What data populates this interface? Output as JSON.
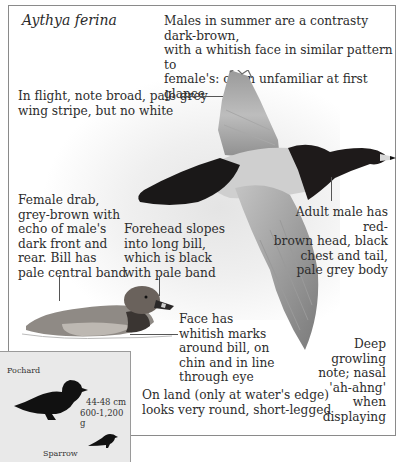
{
  "species": {
    "latin_name": "Aythya ferina",
    "common_name": "Pochard"
  },
  "annotations": {
    "summary": [
      "Males in summer are a contrasty dark-brown,",
      "with a whitish face in similar pattern to",
      "female's: often unfamiliar at first glance"
    ],
    "flight": [
      "In flight, note broad, pale grey",
      "wing stripe, but no white"
    ],
    "female": [
      "Female drab,",
      "grey-brown with",
      "echo of male's",
      "dark front and",
      "rear. Bill has",
      "pale central band"
    ],
    "forehead": [
      "Forehead slopes",
      "into long bill,",
      "which is black",
      "with pale band"
    ],
    "adult_male": [
      "Adult male has red-",
      "brown head, black",
      "chest and tail,",
      "pale grey body"
    ],
    "face": [
      "Face has",
      "whitish marks",
      "around bill, on",
      "chin and in line",
      "through eye"
    ],
    "voice": [
      "Deep",
      "growling",
      "note; nasal",
      "'ah-ahng'",
      "when",
      "displaying"
    ],
    "land": [
      "On land (only at water's edge)",
      "looks very round, short-legged"
    ]
  },
  "size_inset": {
    "species_label": "Pochard",
    "length": "44-48 cm",
    "weight": "600-1,200 g",
    "comparison_label": "Sparrow"
  },
  "colors": {
    "frame_border": "#8a8a8a",
    "inset_bg": "#e9e9e9",
    "male_head": "#1e1a1a",
    "male_body": "#c8c8c8",
    "female_body": "#8f8a85",
    "text": "#2d2d2d"
  }
}
